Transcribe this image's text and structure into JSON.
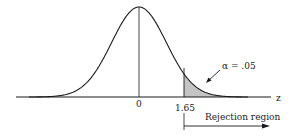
{
  "chart_data": {
    "type": "area",
    "title": "",
    "xlabel": "z",
    "ylabel": "",
    "distribution": "standard normal",
    "mean": 0,
    "critical_value": 1.65,
    "tick_labels": [
      "0",
      "1.65"
    ],
    "shaded_region": {
      "from": 1.65,
      "to": "inf",
      "area": 0.05
    },
    "annotations": [
      "α = .05",
      "Rejection region"
    ],
    "legend": null,
    "grid": false
  },
  "labels": {
    "axis": "z",
    "mean_tick": "0",
    "critical_tick": "1.65",
    "alpha": "α = .05",
    "rejection": "Rejection region"
  },
  "colors": {
    "curve": "#1a1a1a",
    "shade": "#bdbdbd",
    "background": "#ffffff"
  }
}
